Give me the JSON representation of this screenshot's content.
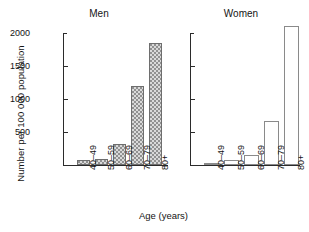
{
  "chart_data": {
    "type": "bar",
    "title": "",
    "xlabel": "Age (years)",
    "ylabel": "Number per 100 000 population",
    "ylim": [
      0,
      2000
    ],
    "yticks": [
      0,
      500,
      1000,
      1500,
      2000
    ],
    "ytick_labels": [
      "",
      "500",
      "1000",
      "1500",
      "2000"
    ],
    "grid": false,
    "legend": "none",
    "categories": [
      "40–49",
      "50–59",
      "60–69",
      "70–79",
      "80+"
    ],
    "panels": [
      {
        "name": "men",
        "title": "Men",
        "fill": "stippled",
        "values": [
          80,
          95,
          320,
          1190,
          1850
        ]
      },
      {
        "name": "women",
        "title": "Women",
        "fill": "white",
        "values": [
          30,
          70,
          150,
          670,
          2100
        ],
        "ytick_labels_shown": false
      }
    ]
  },
  "axes": {
    "y_title": "Number per 100 000 population",
    "x_title": "Age (years)",
    "y_tick_2000": "2000",
    "y_tick_1500": "1500",
    "y_tick_1000": "1000",
    "y_tick_500": "500"
  },
  "panel_men": {
    "title": "Men",
    "cat_0": "40–49",
    "cat_1": "50–59",
    "cat_2": "60–69",
    "cat_3": "70–79",
    "cat_4": "80+"
  },
  "panel_women": {
    "title": "Women",
    "cat_0": "40–49",
    "cat_1": "50–59",
    "cat_2": "60–69",
    "cat_3": "70–79",
    "cat_4": "80+"
  },
  "colors": {
    "axis": "#2b2b2b",
    "men_bar_fill": "#d9d9d9",
    "men_bar_stipple": "#8e8e8e",
    "men_bar_edge": "#6e6e6e",
    "women_bar_fill": "#ffffff",
    "women_bar_edge": "#8a8a8a",
    "text": "#141414",
    "background": "#ffffff"
  }
}
